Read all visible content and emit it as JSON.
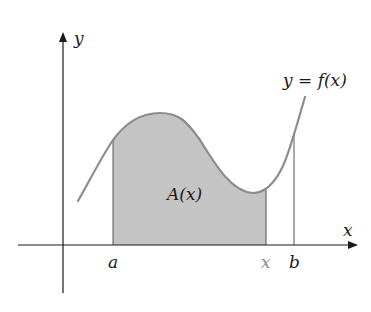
{
  "diagram": {
    "curve_label": "y = f(x)",
    "area_label": "A(x)",
    "axes": {
      "x_label": "x",
      "y_label": "y"
    },
    "ticks": {
      "a": "a",
      "x": "x",
      "b": "b"
    },
    "colors": {
      "curve": "#8c8c8c",
      "fill": "#c4c4c4",
      "axes": "#1a1a1a",
      "moving_x_label": "#8a8a8a"
    }
  }
}
